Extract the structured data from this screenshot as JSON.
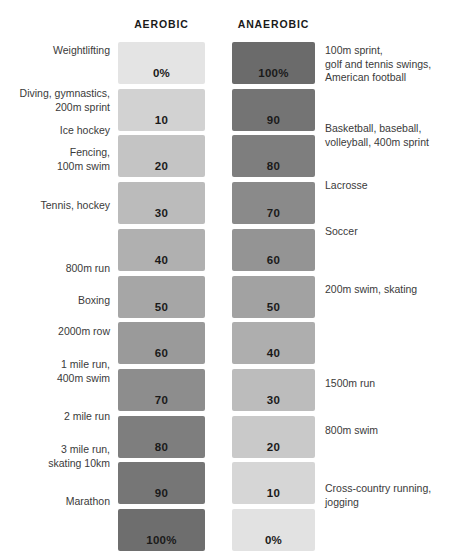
{
  "header": {
    "aerobic_label": "AEROBIC",
    "anaerobic_label": "ANAEROBIC"
  },
  "chart_data": {
    "type": "bar",
    "title": "",
    "xlabel": "",
    "ylabel": "",
    "orientation": "horizontal-paired",
    "grid": false,
    "legend": "none",
    "axis_headers": [
      "AEROBIC",
      "ANAEROBIC"
    ],
    "categories": [
      "Row 1",
      "Row 2",
      "Row 3",
      "Row 4",
      "Row 5",
      "Row 6",
      "Row 7",
      "Row 8",
      "Row 9",
      "Row 10",
      "Row 11"
    ],
    "series": [
      {
        "name": "AEROBIC",
        "values": [
          0,
          10,
          20,
          30,
          40,
          50,
          60,
          70,
          80,
          90,
          100
        ],
        "value_labels": [
          "0%",
          "10",
          "20",
          "30",
          "40",
          "50",
          "60",
          "70",
          "80",
          "90",
          "100%"
        ],
        "colors": [
          "#e4e4e4",
          "#d2d2d2",
          "#c4c4c4",
          "#bbbbbb",
          "#b0b0b0",
          "#a6a6a6",
          "#9a9a9a",
          "#8d8d8d",
          "#7e7e7e",
          "#767676",
          "#6e6e6e"
        ]
      },
      {
        "name": "ANAEROBIC",
        "values": [
          100,
          90,
          80,
          70,
          60,
          50,
          40,
          30,
          20,
          10,
          0
        ],
        "value_labels": [
          "100%",
          "90",
          "80",
          "70",
          "60",
          "50",
          "40",
          "30",
          "20",
          "10",
          "0%"
        ],
        "colors": [
          "#6b6b6b",
          "#747474",
          "#7e7e7e",
          "#8a8a8a",
          "#949494",
          "#a2a2a2",
          "#aeaeae",
          "#bcbcbc",
          "#c9c9c9",
          "#d6d6d6",
          "#e2e2e2"
        ]
      }
    ],
    "left_annotations": [
      "Weightlifting",
      "Diving, gymnastics,\n200m sprint",
      "Ice hockey",
      "Fencing,\n100m swim",
      "Tennis, hockey",
      "800m run",
      "Boxing",
      "2000m row",
      "1 mile run,\n400m swim",
      "2 mile run",
      "3 mile run,\nskating 10km",
      "Marathon"
    ],
    "right_annotations": [
      "100m sprint,\ngolf and tennis swings,\nAmerican football",
      "Basketball, baseball,\nvolleyball, 400m sprint",
      "Lacrosse",
      "Soccer",
      "200m swim, skating",
      "1500m run",
      "800m swim",
      "Cross-country running,\njogging"
    ]
  },
  "left_labels": [
    {
      "text": "Weightlifting",
      "top": 44
    },
    {
      "text": "Diving, gymnastics,\n200m sprint",
      "top": 87
    },
    {
      "text": "Ice hockey",
      "top": 124
    },
    {
      "text": "Fencing,\n100m swim",
      "top": 146
    },
    {
      "text": "Tennis, hockey",
      "top": 199
    },
    {
      "text": "800m run",
      "top": 262
    },
    {
      "text": "Boxing",
      "top": 294
    },
    {
      "text": "2000m row",
      "top": 325
    },
    {
      "text": "1 mile run,\n400m swim",
      "top": 358
    },
    {
      "text": "2 mile run",
      "top": 410
    },
    {
      "text": "3 mile run,\nskating 10km",
      "top": 443
    },
    {
      "text": "Marathon",
      "top": 495
    }
  ],
  "right_labels": [
    {
      "text": "100m sprint,\ngolf and tennis swings,\nAmerican football",
      "top": 44
    },
    {
      "text": "Basketball, baseball,\nvolleyball, 400m sprint",
      "top": 122
    },
    {
      "text": "Lacrosse",
      "top": 179
    },
    {
      "text": "Soccer",
      "top": 225
    },
    {
      "text": "200m swim, skating",
      "top": 283
    },
    {
      "text": "1500m run",
      "top": 377
    },
    {
      "text": "800m swim",
      "top": 424
    },
    {
      "text": "Cross-country running,\njogging",
      "top": 482
    }
  ],
  "bar_geometry": {
    "top": 42,
    "height": 42,
    "gap": 4.7
  }
}
